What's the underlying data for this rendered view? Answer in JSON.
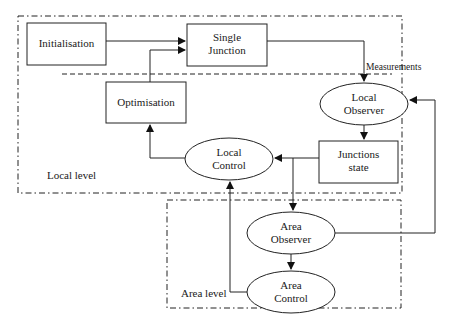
{
  "diagram": {
    "regions": {
      "local": {
        "label": "Local level"
      },
      "area": {
        "label": "Area level"
      }
    },
    "nodes": {
      "initialisation": {
        "label": "Initialisation",
        "shape": "rect"
      },
      "single_junction": {
        "line1": "Single",
        "line2": "Junction",
        "shape": "rect"
      },
      "optimisation": {
        "label": "Optimisation",
        "shape": "rect"
      },
      "local_observer": {
        "line1": "Local",
        "line2": "Observer",
        "shape": "ellipse"
      },
      "junctions_state": {
        "line1": "Junctions",
        "line2": "state",
        "shape": "rect"
      },
      "local_control": {
        "line1": "Local",
        "line2": "Control",
        "shape": "ellipse"
      },
      "area_observer": {
        "line1": "Area",
        "line2": "Observer",
        "shape": "ellipse"
      },
      "area_control": {
        "line1": "Area",
        "line2": "Control",
        "shape": "ellipse"
      }
    },
    "edge_labels": {
      "measurements": "Measurements"
    },
    "edges": [
      [
        "Initialisation",
        "Single Junction"
      ],
      [
        "Optimisation",
        "Single Junction"
      ],
      [
        "Single Junction",
        "Local Observer"
      ],
      [
        "Local Observer",
        "Junctions state"
      ],
      [
        "Junctions state",
        "Local Control"
      ],
      [
        "Junctions state",
        "Area Observer"
      ],
      [
        "Local Control",
        "Optimisation"
      ],
      [
        "Area Observer",
        "Area Control"
      ],
      [
        "Area Observer",
        "Local Observer"
      ],
      [
        "Area Control",
        "Local Control"
      ]
    ]
  }
}
